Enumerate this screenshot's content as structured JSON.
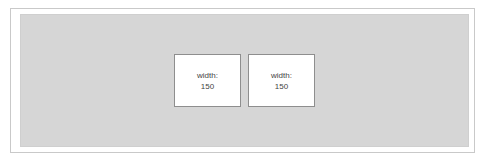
{
  "diagram": {
    "boxes": [
      {
        "label": "width:",
        "value": "150"
      },
      {
        "label": "width:",
        "value": "150"
      }
    ],
    "colors": {
      "container_bg": "#d6d6d6",
      "box_bg": "#ffffff",
      "box_border": "#8e8e8e"
    }
  }
}
